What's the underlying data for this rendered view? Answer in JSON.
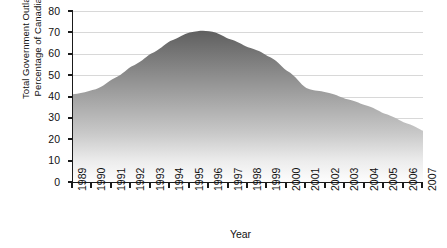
{
  "chart_data": {
    "type": "area",
    "title": "",
    "subtitle": "",
    "xlabel": "Year",
    "ylabel": "Total Government Outlays as a Percentage of Canadian GDP",
    "ylabel_line1": "Total Government Outlays as a",
    "ylabel_line2": "Percentage of Canadian GDP",
    "categories": [
      "1989",
      "1990",
      "1991",
      "1992",
      "1993",
      "1994",
      "1995",
      "1996",
      "1997",
      "1998",
      "1999",
      "2000",
      "2001",
      "2002",
      "2003",
      "2004",
      "2005",
      "2006",
      "2007"
    ],
    "values": [
      41,
      43,
      48,
      54,
      60,
      66,
      70,
      70.5,
      67,
      63,
      59,
      52,
      44,
      42,
      39,
      36,
      32,
      28,
      24
    ],
    "series": [
      {
        "name": "Total Government Outlays as a Percentage of Canadian GDP",
        "values": [
          41,
          43,
          48,
          54,
          60,
          66,
          70,
          70.5,
          67,
          63,
          59,
          52,
          44,
          42,
          39,
          36,
          32,
          28,
          24
        ]
      }
    ],
    "ylim": [
      0,
      80
    ],
    "yticks": [
      0,
      10,
      20,
      30,
      40,
      50,
      60,
      70,
      80
    ],
    "ytick_labels": [
      "0",
      "10",
      "20",
      "30",
      "40",
      "50",
      "60",
      "70",
      "80"
    ],
    "xtick_labels": [
      "1989",
      "1990",
      "1991",
      "1992",
      "1993",
      "1994",
      "1995",
      "1996",
      "1997",
      "1998",
      "1999",
      "2000",
      "2001",
      "2002",
      "2003",
      "2004",
      "2005",
      "2006",
      "2007"
    ],
    "xtick_rotation": -90,
    "grid": true,
    "grid_axis": "y",
    "legend": false,
    "legend_position": "none",
    "fill": {
      "style": "vertical-gradient",
      "top_color": "#686868",
      "bottom_color": "#fefefe"
    },
    "axis_color": "#1a1a1a",
    "grid_color": "#d8d8d8",
    "background": "#ffffff"
  }
}
